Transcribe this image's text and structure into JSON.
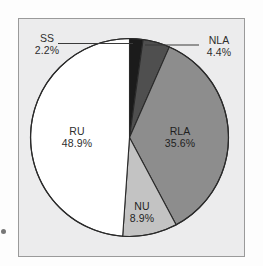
{
  "figure": {
    "background_color": "#fdfdfd",
    "panel_color": "#ececed",
    "panel_border_color": "#9a9a9a"
  },
  "chart_data": {
    "type": "pie",
    "title": "",
    "subtitle": "",
    "xlabel": "",
    "ylabel": "",
    "legend_position": "none",
    "grid": false,
    "start_angle_deg": 0,
    "direction": "clockwise",
    "categories": [
      "SS",
      "NLA",
      "RLA",
      "NU",
      "RU"
    ],
    "values": [
      2.2,
      4.4,
      35.6,
      8.9,
      48.9
    ],
    "value_unit": "%",
    "slices": [
      {
        "label": "SS",
        "value": 2.2,
        "value_text": "2.2%",
        "color": "#1b1b1b",
        "label_placement": "outside",
        "leader_line": true
      },
      {
        "label": "NLA",
        "value": 4.4,
        "value_text": "4.4%",
        "color": "#4f4f4f",
        "label_placement": "outside",
        "leader_line": true
      },
      {
        "label": "RLA",
        "value": 35.6,
        "value_text": "35.6%",
        "color": "#8d8d8d",
        "label_placement": "inside",
        "leader_line": false
      },
      {
        "label": "NU",
        "value": 8.9,
        "value_text": "8.9%",
        "color": "#c3c3c3",
        "label_placement": "inside",
        "leader_line": false
      },
      {
        "label": "RU",
        "value": 48.9,
        "value_text": "48.9%",
        "color": "#ffffff",
        "label_placement": "inside",
        "leader_line": false
      }
    ],
    "slice_outline_color": "#2a2a2a"
  },
  "labels": {
    "ss": {
      "name": "SS",
      "pct": "2.2%"
    },
    "nla": {
      "name": "NLA",
      "pct": "4.4%"
    },
    "rla": {
      "name": "RLA",
      "pct": "35.6%"
    },
    "nu": {
      "name": "NU",
      "pct": "8.9%"
    },
    "ru": {
      "name": "RU",
      "pct": "48.9%"
    }
  }
}
